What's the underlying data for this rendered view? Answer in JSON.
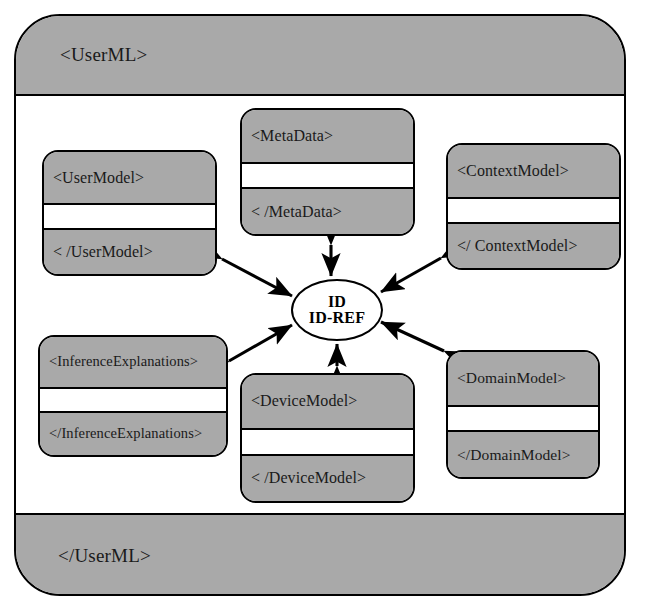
{
  "diagram": {
    "type": "xml-schema-structure-diagram",
    "colors": {
      "fill_gray": "#a9a9a9",
      "fill_white": "#ffffff",
      "stroke": "#000000"
    },
    "container": {
      "name": "UserML",
      "open_tag": "<UserML>",
      "close_tag": "</UserML>"
    },
    "hub": {
      "name": "id-idref",
      "line1": "ID",
      "line2": "ID-REF"
    },
    "nodes": [
      {
        "key": "usermodel",
        "open_tag": "<UserModel>",
        "close_tag": "< /UserModel>"
      },
      {
        "key": "metadata",
        "open_tag": "<MetaData>",
        "close_tag": "< /MetaData>"
      },
      {
        "key": "contextmodel",
        "open_tag": "<ContextModel>",
        "close_tag": "</ ContextModel>"
      },
      {
        "key": "inferenceexplanations",
        "open_tag": "<InferenceExplanations>",
        "close_tag": "</InferenceExplanations>"
      },
      {
        "key": "devicemodel",
        "open_tag": "<DeviceModel>",
        "close_tag": "< /DeviceModel>"
      },
      {
        "key": "domainmodel",
        "open_tag": "<DomainModel>",
        "close_tag": "</DomainModel>"
      }
    ],
    "connectors": [
      {
        "key": "usermodel",
        "from": "usermodel",
        "to": "id-idref",
        "style": "double-headed-arrow"
      },
      {
        "key": "metadata",
        "from": "metadata",
        "to": "id-idref",
        "style": "double-headed-arrow"
      },
      {
        "key": "contextmodel",
        "from": "contextmodel",
        "to": "id-idref",
        "style": "double-headed-arrow"
      },
      {
        "key": "inferenceexplanations",
        "from": "inferenceexplanations",
        "to": "id-idref",
        "style": "double-headed-arrow"
      },
      {
        "key": "devicemodel",
        "from": "devicemodel",
        "to": "id-idref",
        "style": "double-headed-arrow"
      },
      {
        "key": "domainmodel",
        "from": "domainmodel",
        "to": "id-idref",
        "style": "double-headed-arrow"
      }
    ]
  }
}
